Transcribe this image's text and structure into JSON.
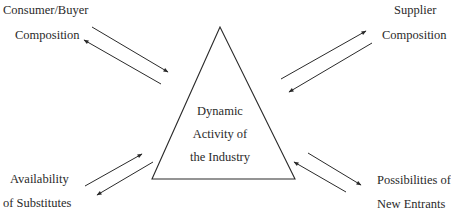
{
  "diagram": {
    "center": {
      "lines": [
        "Dynamic",
        "Activity of",
        "the Industry"
      ]
    },
    "nodes": {
      "top_left": {
        "lines": [
          "Consumer/Buyer",
          "Composition"
        ]
      },
      "top_right": {
        "lines": [
          "Supplier",
          "Composition"
        ]
      },
      "bottom_left": {
        "lines": [
          "Availability",
          "of Substitutes"
        ]
      },
      "bottom_right": {
        "lines": [
          "Possibilities of",
          "New Entrants"
        ]
      }
    },
    "relations": [
      {
        "from": "Consumer/Buyer Composition",
        "to": "Dynamic Activity of the Industry",
        "type": "bidirectional"
      },
      {
        "from": "Supplier Composition",
        "to": "Dynamic Activity of the Industry",
        "type": "bidirectional"
      },
      {
        "from": "Availability of Substitutes",
        "to": "Dynamic Activity of the Industry",
        "type": "bidirectional"
      },
      {
        "from": "Possibilities of New Entrants",
        "to": "Dynamic Activity of the Industry",
        "type": "bidirectional"
      }
    ],
    "colors": {
      "line": "#2a2a2a",
      "background": "#ffffff"
    }
  }
}
